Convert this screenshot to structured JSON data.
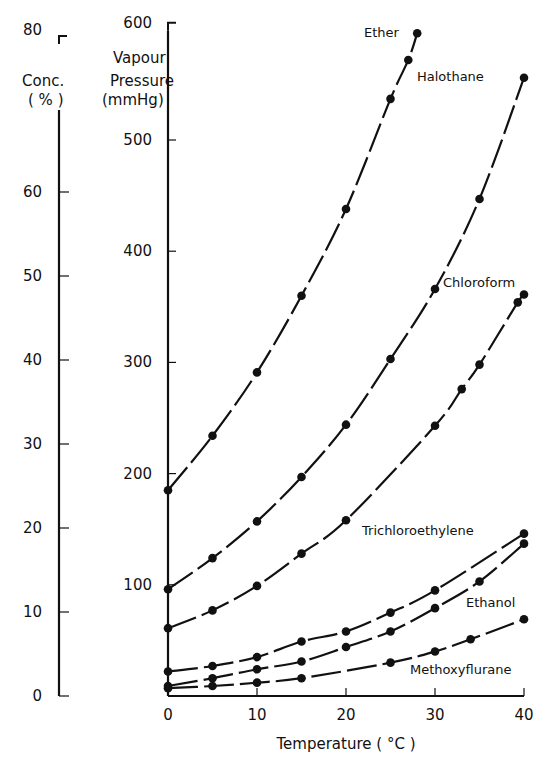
{
  "chart_data": {
    "type": "line",
    "title": "",
    "xlabel": "Temperature (°C)",
    "ylabel": "Vapour Pressure (mmHg)",
    "ylabel_secondary": "Vapour Conc. (%)",
    "xlim": [
      0,
      40
    ],
    "ylim": [
      0,
      600
    ],
    "ylim_secondary": [
      0,
      80
    ],
    "x_ticks": [
      0,
      10,
      20,
      30,
      40
    ],
    "y_ticks": [
      100,
      200,
      300,
      400,
      500,
      600
    ],
    "y_ticks_secondary": [
      0,
      10,
      20,
      30,
      40,
      50,
      60,
      80
    ],
    "grid": false,
    "legend": "inline labels",
    "series": [
      {
        "name": "Ether",
        "x": [
          0,
          5,
          10,
          15,
          20,
          25,
          27,
          28
        ],
        "y": [
          185,
          234,
          291,
          360,
          438,
          537,
          572,
          596
        ],
        "label_pos": [
          364,
          37
        ]
      },
      {
        "name": "Halothane",
        "x": [
          0,
          5,
          10,
          15,
          20,
          25,
          30,
          35,
          40
        ],
        "y": [
          96,
          124,
          157,
          197,
          244,
          303,
          366,
          447,
          556
        ],
        "label_pos": [
          417,
          81
        ]
      },
      {
        "name": "Chloroform",
        "x": [
          0,
          5,
          10,
          15,
          20,
          30,
          33,
          35,
          39.3,
          40
        ],
        "y": [
          61,
          77,
          99,
          128,
          158,
          243,
          276,
          298,
          354,
          361
        ],
        "label_pos": [
          443,
          287
        ]
      },
      {
        "name": "Trichloroethylene",
        "x": [
          0,
          5,
          10,
          15,
          20,
          25,
          30,
          40
        ],
        "y": [
          22,
          27,
          35,
          49,
          58,
          75,
          95,
          146
        ],
        "label_pos": [
          362,
          535
        ]
      },
      {
        "name": "Ethanol",
        "x": [
          0,
          5,
          10,
          15,
          20,
          25,
          30,
          35,
          40
        ],
        "y": [
          9,
          16,
          24,
          31,
          44,
          58,
          79,
          103,
          137
        ],
        "label_pos": [
          466,
          607
        ]
      },
      {
        "name": "Methoxyflurane",
        "x": [
          0,
          5,
          10,
          15,
          25,
          30,
          34,
          40
        ],
        "y": [
          7,
          9,
          12,
          16,
          30,
          40,
          51,
          69
        ],
        "label_pos": [
          410,
          674
        ]
      }
    ]
  },
  "axes": {
    "left_header": [
      "Conc.",
      "( % )"
    ],
    "left_top": "Vapour",
    "right_header": [
      "Pressure",
      "(mmHg)"
    ],
    "x_title": "Temperature ( °C )"
  }
}
